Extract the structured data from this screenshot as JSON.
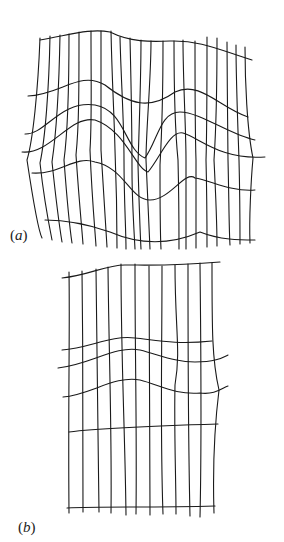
{
  "figure": {
    "panels": [
      {
        "id": "a",
        "label": "(a)",
        "label_letter": "a",
        "vertical_lines": [
          "M40 38 C38 90 33 140 27 160 C33 200 38 230 42 238",
          "M50 36 C49 90 45 140 40 163 C44 200 50 230 52 240",
          "M60 35 C59 90 56 135 52 162 C56 200 60 230 62 242",
          "M69 34 C69 90 68 130 64 160 C67 200 70 230 72 243",
          "M79 32 C79 90 79 125 76 155 C79 200 82 230 83 244",
          "M91 31 C91 90 92 120 90 150 C92 200 95 230 96 246",
          "M101 31 C101 90 101 115 101 150 C104 200 106 230 107 247",
          "M111 31 C112 80 114 110 115 150 C117 200 117 230 117 248",
          "M120 37 C121 80 124 120 124 160 C124 200 126 230 126 249",
          "M130 38 C131 80 132 120 132 170 C132 200 134 230 135 249",
          "M141 40 C141 80 139 130 138 165 C139 200 140 230 141 249",
          "M151 41 C151 80 146 130 146 160 C148 200 149 230 150 249",
          "M163 41 C163 80 162 130 160 165 C160 200 160 230 161 249",
          "M174 41 C174 80 175 130 178 160 C179 200 179 230 179 249",
          "M183 40 C183 80 186 130 186 160 C186 200 186 230 186 249",
          "M195 41 C195 80 195 130 196 160 C196 200 196 230 196 248",
          "M207 37 C207 80 207 130 206 160 C207 200 207 230 207 247",
          "M217 38 C217 80 216 130 214 160 C216 200 217 230 217 246",
          "M227 42 C227 80 228 130 228 160 C229 200 229 230 230 245",
          "M236 45 C236 80 238 130 239 160 C240 200 240 230 240 244",
          "M245 47 C245 80 247 130 253 158 C251 180 249 220 250 243"
        ],
        "horizontal_lines": [
          "M40 40 C70 35 90 28 110 32 C130 42 150 42 170 41 C200 40 220 50 252 60",
          "M28 96 C60 95 80 70 105 85 C130 105 150 110 175 92 C200 80 220 108 248 117",
          "M25 134 C45 135 60 100 95 105 C125 110 125 150 145 158 C158 140 160 112 180 112 C200 112 230 135 255 140",
          "M22 152 C50 155 70 115 95 120 C125 130 135 168 148 172 C160 158 170 130 183 133 C200 138 220 160 265 157",
          "M32 173 C60 175 75 155 95 162 C125 168 130 200 150 200 C170 200 185 170 195 178 C210 180 230 192 255 190",
          "M45 220 C70 220 90 225 110 232 C140 245 170 245 200 232 C220 240 240 240 255 240"
        ]
      },
      {
        "id": "b",
        "label": "(b)",
        "label_letter": "b",
        "vertical_lines": [
          "M69 272 C70 330 68 400 69 513",
          "M82 271 C83 350 83 420 83 512",
          "M96 269 C97 360 98 430 99 512",
          "M108 267 C109 360 112 430 111 513",
          "M121 264 C121 360 125 430 126 515",
          "M135 264 C135 360 137 430 136 514",
          "M149 266 C149 360 150 430 150 515",
          "M162 266 C162 360 160 430 163 514",
          "M175 265 C175 330 181 350 175 385 C174 430 176 480 176 514",
          "M188 264 C188 360 188 430 190 516",
          "M200 263 C201 360 202 430 200 517",
          "M212 263 C212 330 212 360 219 390 C214 430 213 480 214 513"
        ],
        "horizontal_lines": [
          "M62 278 C90 275 105 265 125 265 C150 265 175 266 220 262",
          "M62 350 C90 348 110 335 135 338 C155 340 175 345 212 341",
          "M58 368 C90 365 115 345 140 350 C160 355 175 362 195 362 C215 362 222 358 228 355",
          "M63 397 C90 395 115 375 140 380 C160 385 175 395 200 393 C215 395 222 388 228 386",
          "M69 432 C100 428 150 426 218 424",
          "M67 508 C100 506 150 508 215 506"
        ]
      }
    ]
  }
}
